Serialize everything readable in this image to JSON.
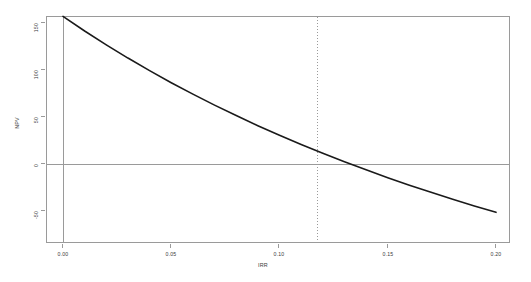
{
  "chart_data": {
    "type": "line",
    "title": "",
    "xlabel": "IRR",
    "ylabel": "NPV",
    "xlim": [
      0.0,
      0.2
    ],
    "ylim": [
      -75,
      165
    ],
    "grid": false,
    "legend": null,
    "x_ticks": [
      "0.00",
      "0.05",
      "0.10",
      "0.15",
      "0.20"
    ],
    "x_tick_values": [
      0.0,
      0.05,
      0.1,
      0.15,
      0.2
    ],
    "y_ticks": [
      "150",
      "100",
      "50",
      "0",
      "-50"
    ],
    "y_tick_values": [
      150,
      100,
      50,
      0,
      -50
    ],
    "series": [
      {
        "name": "NPV",
        "color": "#1a1a1a",
        "x": [
          0.0,
          0.01,
          0.02,
          0.03,
          0.04,
          0.05,
          0.06,
          0.07,
          0.08,
          0.09,
          0.1,
          0.11,
          0.12,
          0.13,
          0.14,
          0.15,
          0.16,
          0.17,
          0.18,
          0.19,
          0.2
        ],
        "values": [
          157.0,
          141.5,
          126.8,
          112.7,
          99.3,
          86.5,
          74.3,
          62.6,
          51.5,
          40.8,
          30.6,
          20.8,
          11.4,
          2.4,
          -6.2,
          -14.5,
          -22.5,
          -30.1,
          -37.5,
          -44.6,
          -51.4
        ]
      }
    ],
    "annotations": [
      {
        "name": "irr-vertical-line",
        "type": "vline",
        "x": 0.1175,
        "style": "dotted",
        "color": "#9a9a9a"
      },
      {
        "name": "zero-horizontal-line",
        "type": "hline",
        "y": 0,
        "style": "solid",
        "color": "#9a9a9a"
      },
      {
        "name": "origin-vertical-line",
        "type": "vline",
        "x": 0.0,
        "style": "solid",
        "color": "#9a9a9a"
      }
    ]
  },
  "colors": {
    "curve": "#1a1a1a",
    "axis": "#9a9a9a",
    "text": "#3b3b3b",
    "background": "#ffffff"
  }
}
